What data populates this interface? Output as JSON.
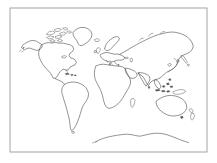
{
  "figure": {
    "kind": "world-outline-map",
    "caption": "",
    "width_px": 217,
    "height_px": 163,
    "background_color": "#ffffff",
    "frame": {
      "visible": true,
      "color": "#9a9a9a",
      "stroke_width_px": 0.9,
      "x": 10,
      "y": 8,
      "width": 197,
      "height": 144
    },
    "coastline": {
      "color": "#3a3a3a",
      "stroke_width_px": 0.55,
      "fill": "none"
    },
    "labels_visible": false,
    "graticule_visible": false,
    "legend_visible": false
  },
  "map_content": {
    "projection_hint": "equirectangular-like",
    "landmasses": [
      {
        "name": "Greenland",
        "bbox": [
          72,
          27,
          93,
          46
        ]
      },
      {
        "name": "Canadian Arctic Archipelago",
        "bbox": [
          44,
          27,
          74,
          44
        ]
      },
      {
        "name": "Alaska",
        "bbox": [
          20,
          38,
          40,
          52
        ]
      },
      {
        "name": "North America",
        "bbox": [
          24,
          40,
          78,
          78
        ]
      },
      {
        "name": "Central America",
        "bbox": [
          50,
          70,
          68,
          82
        ]
      },
      {
        "name": "Caribbean Islands",
        "bbox": [
          62,
          70,
          76,
          78
        ]
      },
      {
        "name": "South America",
        "bbox": [
          58,
          76,
          92,
          131
        ]
      },
      {
        "name": "Iceland",
        "bbox": [
          94,
          38,
          100,
          43
        ]
      },
      {
        "name": "British Isles",
        "bbox": [
          94,
          47,
          101,
          55
        ]
      },
      {
        "name": "Scandinavia",
        "bbox": [
          104,
          36,
          119,
          50
        ]
      },
      {
        "name": "Europe",
        "bbox": [
          95,
          45,
          128,
          66
        ]
      },
      {
        "name": "Mediterranean Sea",
        "bbox": [
          96,
          58,
          124,
          68
        ]
      },
      {
        "name": "Africa",
        "bbox": [
          94,
          63,
          133,
          112
        ]
      },
      {
        "name": "Madagascar",
        "bbox": [
          130,
          98,
          136,
          108
        ]
      },
      {
        "name": "Arabian Peninsula",
        "bbox": [
          124,
          66,
          138,
          80
        ]
      },
      {
        "name": "Asia",
        "bbox": [
          118,
          30,
          196,
          85
        ]
      },
      {
        "name": "India",
        "bbox": [
          138,
          70,
          152,
          86
        ]
      },
      {
        "name": "Sri Lanka",
        "bbox": [
          148,
          85,
          151,
          89
        ]
      },
      {
        "name": "China",
        "bbox": [
          152,
          55,
          180,
          78
        ]
      },
      {
        "name": "Japan",
        "bbox": [
          180,
          55,
          190,
          68
        ]
      },
      {
        "name": "Southeast Asia",
        "bbox": [
          152,
          76,
          172,
          92
        ]
      },
      {
        "name": "Indonesia",
        "bbox": [
          150,
          86,
          178,
          98
        ]
      },
      {
        "name": "New Guinea",
        "bbox": [
          172,
          88,
          186,
          96
        ]
      },
      {
        "name": "Australia",
        "bbox": [
          154,
          94,
          188,
          117
        ]
      },
      {
        "name": "Tasmania",
        "bbox": [
          180,
          115,
          184,
          119
        ]
      },
      {
        "name": "New Zealand",
        "bbox": [
          189,
          108,
          196,
          122
        ]
      },
      {
        "name": "Antarctica",
        "bbox": [
          95,
          131,
          190,
          144
        ]
      }
    ],
    "oceans_labeled": []
  }
}
